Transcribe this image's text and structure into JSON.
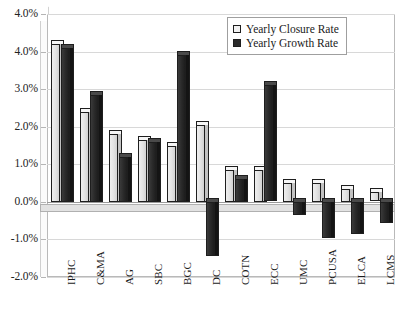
{
  "chart_data": {
    "type": "bar",
    "title": "",
    "xlabel": "",
    "ylabel": "",
    "grid": true,
    "legend_position": "top-right",
    "ylim": [
      -2.0,
      5.0
    ],
    "ytick_labels": [
      "4.0%",
      "4.0%",
      "3.0%",
      "2.0%",
      "1.0%",
      "0.0%",
      "-1.0%",
      "-2.0%"
    ],
    "ytick_values": [
      5.0,
      4.0,
      3.0,
      2.0,
      1.0,
      0.0,
      -1.0,
      -2.0
    ],
    "categories": [
      "IPHC",
      "C&MA",
      "AG",
      "SBC",
      "BGC",
      "DC",
      "COTN",
      "ECC",
      "UMC",
      "PCUSA",
      "ELCA",
      "LCMS"
    ],
    "series": [
      {
        "name": "Yearly Closure Rate",
        "color": "#e6e6e6",
        "values": [
          4.2,
          2.4,
          1.8,
          1.65,
          1.5,
          2.05,
          0.85,
          0.85,
          0.5,
          0.5,
          0.35,
          0.25
        ]
      },
      {
        "name": "Yearly Growth Rate",
        "color": "#2b2b2b",
        "values": [
          4.1,
          2.85,
          1.2,
          1.6,
          3.9,
          -1.45,
          0.6,
          3.1,
          -0.35,
          -0.95,
          -0.85,
          -0.55
        ]
      }
    ]
  },
  "legend": {
    "items": [
      {
        "label": "Yearly Closure Rate",
        "swatch": "light"
      },
      {
        "label": "Yearly Growth Rate",
        "swatch": "dark"
      }
    ]
  }
}
